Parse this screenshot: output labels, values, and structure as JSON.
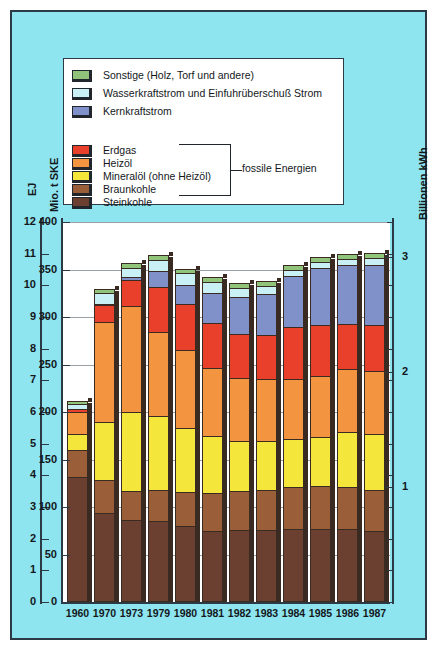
{
  "chart_data": {
    "type": "bar",
    "title": "",
    "stacked": true,
    "grid": true,
    "legend_position": "top-inside",
    "categories": [
      "1960",
      "1970",
      "1973",
      "1979",
      "1980",
      "1981",
      "1982",
      "1983",
      "1984",
      "1985",
      "1986",
      "1987"
    ],
    "axes": {
      "left_outer": {
        "label": "EJ",
        "ticks": [
          "0",
          "1",
          "2",
          "3",
          "4",
          "5",
          "6",
          "7",
          "8",
          "9",
          "10",
          "11",
          "12"
        ],
        "range": [
          0,
          12
        ]
      },
      "left_inner": {
        "label": "Mio. t SKE",
        "ticks": [
          "0",
          "50",
          "100",
          "150",
          "200",
          "250",
          "300",
          "350",
          "400"
        ],
        "range": [
          0,
          400
        ]
      },
      "right": {
        "label": "Billionen kWh",
        "ticks": [
          "1",
          "2",
          "3"
        ],
        "range": [
          0,
          3.3
        ]
      }
    },
    "unit": "Mio. t SKE",
    "series": [
      {
        "name": "Steinkohle",
        "color": "#6b4030",
        "values": [
          132,
          94,
          86,
          85,
          80,
          75,
          76,
          76,
          77,
          77,
          77,
          75
        ]
      },
      {
        "name": "Braunkohle",
        "color": "#9a5f38",
        "values": [
          160,
          128,
          117,
          118,
          116,
          115,
          117,
          118,
          121,
          122,
          121,
          118
        ]
      },
      {
        "name": "Mineralöl (ohne Heizöl)",
        "color": "#f5e63c",
        "values": [
          177,
          189,
          200,
          196,
          183,
          175,
          170,
          170,
          172,
          174,
          179,
          177
        ]
      },
      {
        "name": "Heizöl",
        "color": "#f29440",
        "values": [
          200,
          295,
          312,
          284,
          265,
          246,
          236,
          235,
          235,
          238,
          245,
          243
        ]
      },
      {
        "name": "Erdgas",
        "color": "#e8402a",
        "values": [
          203,
          313,
          339,
          332,
          314,
          294,
          282,
          281,
          290,
          292,
          293,
          292
        ]
      },
      {
        "name": "Kernkraftstrom",
        "color": "#8090c8",
        "values": [
          203,
          314,
          342,
          348,
          334,
          325,
          321,
          324,
          343,
          352,
          355,
          355
        ]
      },
      {
        "name": "Wasserkraftstrom und Einfuhrüberschuß Strom",
        "color": "#c8f0f5",
        "values": [
          208,
          325,
          352,
          360,
          346,
          337,
          331,
          333,
          350,
          358,
          361,
          362
        ]
      },
      {
        "name": "Sonstige (Holz, Torf und andere)",
        "color": "#8fc47a",
        "values": [
          212,
          330,
          357,
          365,
          351,
          342,
          336,
          338,
          355,
          363,
          366,
          367
        ]
      }
    ],
    "totals": [
      212,
      330,
      357,
      365,
      351,
      342,
      336,
      338,
      355,
      363,
      366,
      367
    ]
  },
  "legend": {
    "items": [
      {
        "label": "Sonstige (Holz, Torf und andere)",
        "color": "#8fc47a"
      },
      {
        "label": "Wasserkraftstrom und Einfuhrüberschuß Strom",
        "color": "#c8f0f5"
      },
      {
        "label": "Kernkraftstrom",
        "color": "#8090c8"
      },
      {
        "label": "Erdgas",
        "color": "#e8402a"
      },
      {
        "label": "Heizöl",
        "color": "#f29440"
      },
      {
        "label": "Mineralöl (ohne Heizöl)",
        "color": "#f5e63c"
      },
      {
        "label": "Braunkohle",
        "color": "#9a5f38"
      },
      {
        "label": "Steinkohle",
        "color": "#6b4030"
      }
    ],
    "bracket_label": "fossile  Energien"
  },
  "colors": {
    "background": "#8ee4ef",
    "frame": "#2b3a44",
    "plot_background": "#ffffff",
    "gridline": "#9aa0a4",
    "bar_outline": "#3a2b22"
  }
}
